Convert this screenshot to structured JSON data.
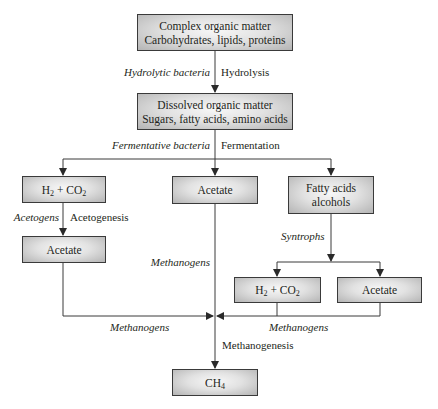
{
  "nodes": {
    "complex": {
      "line1": "Complex organic matter",
      "line2": "Carbohydrates, lipids, proteins"
    },
    "dissolved": {
      "line1": "Dissolved organic matter",
      "line2": "Sugars, fatty acids, amino acids"
    },
    "h2co2_left": {
      "main": "H",
      "sub1": "2",
      "mid": " + CO",
      "sub2": "2"
    },
    "acetate_mid": {
      "label": "Acetate"
    },
    "fatty": {
      "line1": "Fatty acids",
      "line2": "alcohols"
    },
    "acetate_left": {
      "label": "Acetate"
    },
    "h2co2_right": {
      "main": "H",
      "sub1": "2",
      "mid": " + CO",
      "sub2": "2"
    },
    "acetate_right": {
      "label": "Acetate"
    },
    "ch4": {
      "main": "CH",
      "sub": "4"
    }
  },
  "labels": {
    "hydrolytic_bacteria": "Hydrolytic bacteria",
    "hydrolysis": "Hydrolysis",
    "fermentative_bacteria": "Fermentative bacteria",
    "fermentation": "Fermentation",
    "acetogens": "Acetogens",
    "acetogenesis": "Acetogenesis",
    "methanogens_mid": "Methanogens",
    "syntrophs": "Syntrophs",
    "methanogens_left": "Methanogens",
    "methanogens_right": "Methanogens",
    "methanogenesis": "Methanogenesis"
  },
  "colors": {
    "line": "#3a3a3a",
    "box_border": "#3a3a3a"
  }
}
